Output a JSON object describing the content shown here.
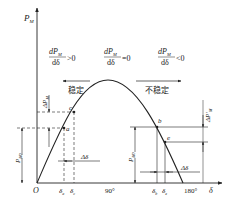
{
  "axes": {
    "y_label": "P",
    "y_label_sub": "M",
    "x_label": "δ",
    "origin": "O",
    "x_ticks": [
      "90°",
      "180°"
    ]
  },
  "regions": {
    "left": {
      "derivative_num": "dP",
      "derivative_num_sub": "M",
      "derivative_den": "dδ",
      "relation": ">0",
      "label": "稳定"
    },
    "middle": {
      "derivative_num": "dP",
      "derivative_num_sub": "M",
      "derivative_den": "dδ",
      "relation": "=0"
    },
    "right": {
      "derivative_num": "dP",
      "derivative_num_sub": "M",
      "derivative_den": "dδ",
      "relation": "<0",
      "label": "不稳定"
    }
  },
  "points": {
    "a": "a",
    "b": "b",
    "c": "c",
    "e": "e"
  },
  "annotations": {
    "delta_p_left": "ΔP",
    "delta_p_left_sub": "M",
    "delta_p_right": "ΔP′",
    "delta_p_right_sub": "M",
    "p_left": "P",
    "p_left_sub": "M0",
    "p_right": "P",
    "p_right_sub": "M0",
    "delta_delta_left": "Δδ",
    "delta_delta_right": "Δδ",
    "delta_a": "δ",
    "delta_a_sub": "a",
    "delta_c": "δ",
    "delta_c_sub": "c",
    "delta_b": "δ",
    "delta_b_sub": "b",
    "delta_e": "δ",
    "delta_e_sub": "e"
  },
  "colors": {
    "line": "#222222",
    "background": "#ffffff"
  }
}
